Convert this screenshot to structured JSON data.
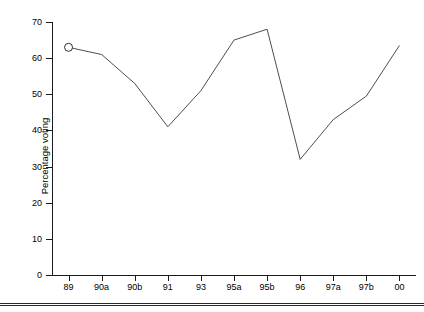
{
  "chart_data": {
    "type": "line",
    "title": "",
    "xlabel": "",
    "ylabel": "Percentage voting",
    "categories": [
      "89",
      "90a",
      "90b",
      "91",
      "93",
      "95a",
      "95b",
      "96",
      "97a",
      "97b",
      "00"
    ],
    "values": [
      63,
      61,
      53,
      41,
      51,
      65,
      68,
      32,
      43,
      49.5,
      63.5
    ],
    "marker_types": [
      "circle",
      "star",
      "star",
      "circle",
      "circle",
      "star",
      "star",
      "square",
      "square",
      "circle",
      "star"
    ],
    "ylim": [
      0,
      70
    ],
    "yticks": [
      0,
      10,
      20,
      30,
      40,
      50,
      60,
      70
    ],
    "ytick_labels": [
      "0",
      "10",
      "20",
      "30",
      "40",
      "50",
      "60",
      "70"
    ],
    "grid": false,
    "legend_position": "inside-center-bottom",
    "series": [
      {
        "name": "voting turnout",
        "values": [
          63,
          61,
          53,
          41,
          51,
          65,
          68,
          32,
          43,
          49.5,
          63.5
        ]
      }
    ],
    "legend": [
      {
        "marker": "circle",
        "label": "Parliamentary election"
      },
      {
        "marker": "star",
        "label": "Presidential election"
      },
      {
        "marker": "square",
        "label": "Referendum"
      }
    ],
    "line_color": "#3a3a3a",
    "marker_color": "#1a1a1a"
  }
}
